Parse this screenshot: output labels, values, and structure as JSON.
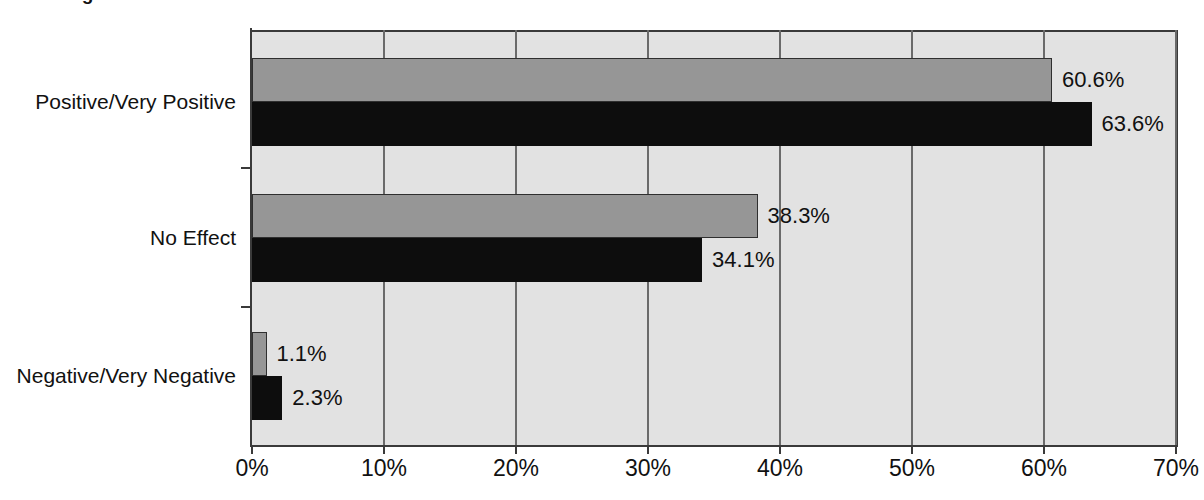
{
  "title_partial": "Percentage",
  "chart_data": {
    "type": "bar",
    "orientation": "horizontal",
    "title": "",
    "xlabel": "",
    "ylabel": "",
    "xlim": [
      0,
      70
    ],
    "xticks": [
      "0%",
      "10%",
      "20%",
      "30%",
      "40%",
      "50%",
      "60%",
      "70%"
    ],
    "xtick_values": [
      0,
      10,
      20,
      30,
      40,
      50,
      60,
      70
    ],
    "grid": true,
    "legend": "none",
    "categories": [
      "Positive/Very Positive",
      "No Effect",
      "Negative/Very Negative"
    ],
    "series": [
      {
        "name": "Series 1",
        "color": "#969696",
        "values": [
          60.6,
          38.3,
          1.1
        ],
        "labels": [
          "60.6%",
          "38.3%",
          "1.1%"
        ]
      },
      {
        "name": "Series 2",
        "color": "#0d0d0d",
        "values": [
          63.6,
          34.1,
          2.3
        ],
        "labels": [
          "63.6%",
          "34.1%",
          "2.3%"
        ]
      }
    ],
    "plot_background": "#e2e2e2",
    "axis_color": "#3a3a3a",
    "gridline_color": "#6a6a6a"
  }
}
